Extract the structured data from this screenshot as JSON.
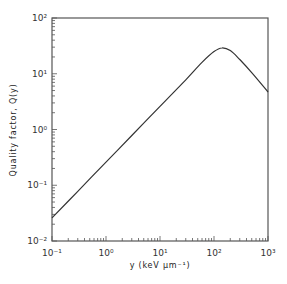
{
  "chart_data": {
    "type": "line",
    "title": "",
    "xlabel": "y (keV µm⁻¹)",
    "ylabel": "Quality factor, Q(y)",
    "xscale": "log",
    "yscale": "log",
    "xlim": [
      0.1,
      1000
    ],
    "ylim": [
      0.01,
      100
    ],
    "x_ticks": [
      "10⁻¹",
      "10⁰",
      "10¹",
      "10²",
      "10³"
    ],
    "y_ticks": [
      "10⁻²",
      "10⁻¹",
      "10⁰",
      "10¹",
      "10²"
    ],
    "grid": false,
    "legend": null,
    "series": [
      {
        "name": "Q(y)",
        "x": [
          0.1,
          0.3,
          1,
          3,
          10,
          30,
          60,
          100,
          140,
          200,
          300,
          500,
          1000
        ],
        "y": [
          0.026,
          0.078,
          0.26,
          0.78,
          2.6,
          7.8,
          16,
          25,
          29,
          26,
          18,
          10.5,
          4.7
        ]
      }
    ]
  }
}
